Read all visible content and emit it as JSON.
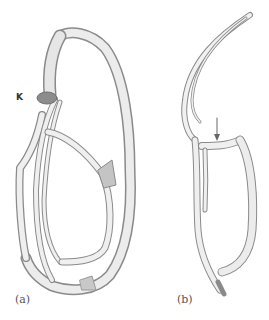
{
  "figure": {
    "panels": [
      {
        "id": "a",
        "label": "(a)"
      },
      {
        "id": "b",
        "label": "(b)"
      }
    ],
    "annotations": {
      "k_label": "K",
      "arrow": "down-arrow"
    },
    "colors": {
      "tube_fill": "#e9e9e9",
      "tube_stroke": "#8a8a8a",
      "tube_shade": "#b5b5b5",
      "k_blob": "#8c8c8c",
      "label_text": "#555555",
      "background": "#ffffff"
    }
  }
}
